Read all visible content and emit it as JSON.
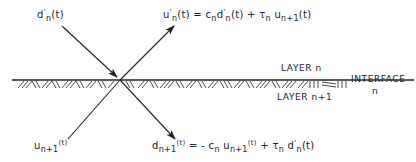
{
  "diagram": {
    "type": "wave-interface-reflection-transmission",
    "signals": {
      "incident_down": {
        "symbol": "d",
        "prime": "'",
        "sub": "n",
        "arg": "(t)"
      },
      "reflected_up": {
        "lhs": {
          "symbol": "u",
          "prime": "'",
          "sub": "n",
          "arg": "(t)"
        },
        "equation": "u'_n(t) = c_n d'_n(t) + τ_n u_{n+1}(t)",
        "rhs_parts": [
          "=",
          "c",
          "n",
          "d",
          "'",
          "n",
          "(t)",
          "+",
          "τ",
          "n",
          "u",
          "n+1",
          "(t)"
        ]
      },
      "incident_up": {
        "symbol": "u",
        "sub": "n+1",
        "arg": "(t)"
      },
      "transmitted_down": {
        "lhs": {
          "symbol": "d",
          "sub": "n+1",
          "arg": "(t)"
        },
        "equation": "d_{n+1}(t) = -c_n u_{n+1}(t) + τ_n d'_n(t)",
        "rhs_parts": [
          "= -",
          "c",
          "n",
          "u",
          "n+1",
          "(t)",
          "+",
          "τ",
          "n",
          "d",
          "'",
          "n",
          "(t)"
        ]
      }
    },
    "labels": {
      "layer_upper": "LAYER n",
      "layer_lower": "LAYER n+1",
      "interface": "INTERFACE",
      "interface_index": "n"
    },
    "colors": {
      "ink": "#222222",
      "background": "#ffffff"
    }
  }
}
